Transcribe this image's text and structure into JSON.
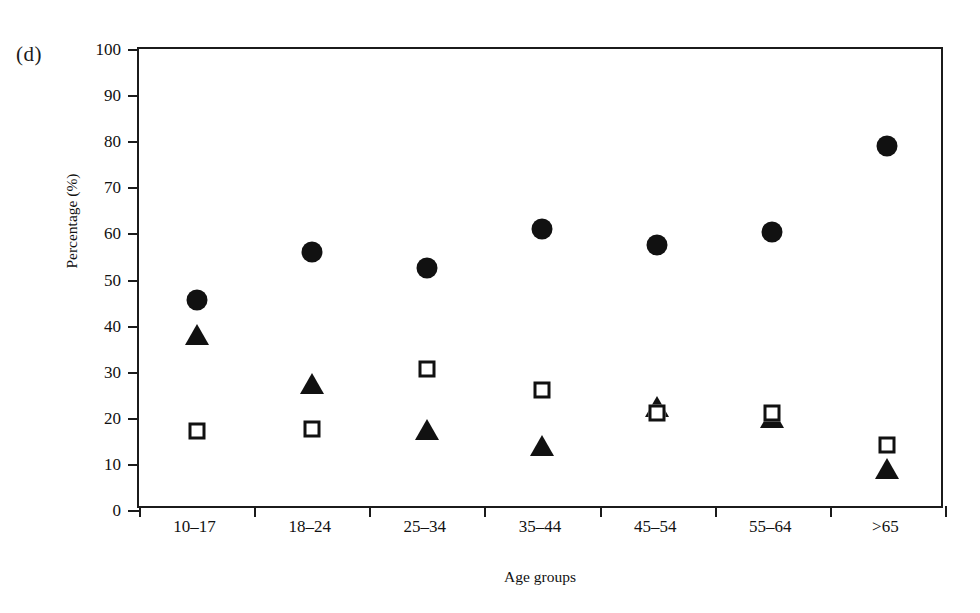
{
  "figure": {
    "panel_label": "(d)",
    "background_color": "#ffffff",
    "ink_color": "#111111"
  },
  "chart_data": {
    "type": "scatter",
    "title": "",
    "panel": "(d)",
    "xlabel": "Age groups",
    "ylabel": "Percentage (%)",
    "categories": [
      "10–17",
      "18–24",
      "25–34",
      "35–44",
      "45–54",
      "55–64",
      ">65"
    ],
    "ylim": [
      0,
      100
    ],
    "yticks": [
      0,
      10,
      20,
      30,
      40,
      50,
      60,
      70,
      80,
      90,
      100
    ],
    "ytick_labels": [
      "0",
      "10",
      "20",
      "30",
      "40",
      "50",
      "60",
      "70",
      "80",
      "90",
      "100"
    ],
    "grid": false,
    "legend": "none",
    "series": [
      {
        "name": "filled-circle",
        "marker": "filled circle",
        "color": "#111111",
        "values": [
          45.5,
          56,
          52.5,
          61,
          57.5,
          60.3,
          79
        ]
      },
      {
        "name": "filled-triangle",
        "marker": "filled triangle",
        "color": "#111111",
        "values": [
          37.5,
          27,
          17,
          13.5,
          22,
          19.5,
          8.5
        ]
      },
      {
        "name": "open-square",
        "marker": "open square",
        "color": "#111111",
        "values": [
          17.2,
          17.6,
          30.6,
          26,
          21,
          21,
          14
        ]
      }
    ]
  }
}
